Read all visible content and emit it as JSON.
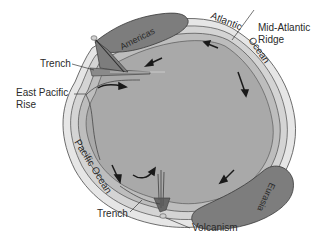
{
  "diagram": {
    "labels": {
      "americas": "Americas",
      "eurasia": "Eurasia",
      "atlantic": "Atlantic",
      "ocean_atlantic": "Ocean",
      "mid_atlantic_1": "Mid-Atlantic",
      "mid_atlantic_2": "Ridge",
      "trench_top": "Trench",
      "east_pacific_1": "East Pacific",
      "east_pacific_2": "Rise",
      "pacific_ocean": "Pacific Ocean",
      "trench_bottom": "Trench",
      "volcanism": "Volcanism"
    },
    "colors": {
      "mantle": "#a9a9a9",
      "asthenosphere": "#bdbdbd",
      "lithosphere": "#d4d4d4",
      "ocean_crust": "#e6e6e6",
      "continent": "#7d7d7d",
      "outline": "#3a3a3a",
      "text": "#2a2a2a"
    }
  }
}
